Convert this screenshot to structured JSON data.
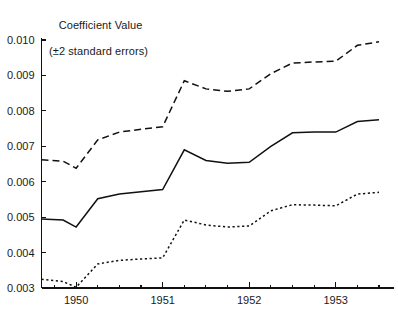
{
  "chart_data": {
    "type": "line",
    "title": "Coefficient Value",
    "subtitle": "(±2 standard errors)",
    "title_line1": "Coefficient Value",
    "title_line2": "(±2 standard errors)",
    "xlabel": "",
    "ylabel": "Coefficient Value (±2 standard errors)",
    "ylim": [
      0.003,
      0.01
    ],
    "xlim": [
      1949.6,
      1953.65
    ],
    "grid": false,
    "legend": "none",
    "ytick_labels": [
      "0.003",
      "0.004",
      "0.005",
      "0.006",
      "0.007",
      "0.008",
      "0.009",
      "0.010"
    ],
    "ytick_values": [
      0.003,
      0.004,
      0.005,
      0.006,
      0.007,
      0.008,
      0.009,
      0.01
    ],
    "xtick_labels": [
      "1950",
      "1951",
      "1952",
      "1953"
    ],
    "xtick_values": [
      1950,
      1951,
      1952,
      1953
    ],
    "x_minor_step": 0.25,
    "x": [
      1949.6,
      1949.85,
      1950.0,
      1950.25,
      1950.5,
      1950.75,
      1951.0,
      1951.25,
      1951.5,
      1951.75,
      1952.0,
      1952.25,
      1952.5,
      1952.75,
      1953.0,
      1953.25,
      1953.5
    ],
    "series": [
      {
        "name": "upper-bound",
        "style": "dashed",
        "values": [
          0.00662,
          0.00658,
          0.00638,
          0.00718,
          0.0074,
          0.00748,
          0.00755,
          0.00885,
          0.00862,
          0.00855,
          0.00862,
          0.00905,
          0.00935,
          0.00938,
          0.0094,
          0.00985,
          0.00995
        ]
      },
      {
        "name": "point-estimate",
        "style": "solid",
        "values": [
          0.00495,
          0.00492,
          0.00472,
          0.00552,
          0.00565,
          0.00572,
          0.00578,
          0.0069,
          0.0066,
          0.00652,
          0.00655,
          0.007,
          0.00738,
          0.0074,
          0.0074,
          0.0077,
          0.00775
        ]
      },
      {
        "name": "lower-bound",
        "style": "dotted",
        "values": [
          0.00325,
          0.00318,
          0.00302,
          0.00368,
          0.00378,
          0.00382,
          0.00385,
          0.00492,
          0.00478,
          0.00472,
          0.00475,
          0.00518,
          0.00535,
          0.00534,
          0.00532,
          0.00565,
          0.0057
        ]
      }
    ]
  },
  "colors": {
    "ink": "#111111",
    "background": "#ffffff"
  }
}
